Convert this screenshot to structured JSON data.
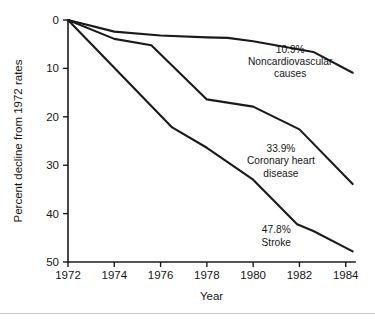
{
  "chart_data": {
    "type": "line",
    "title": "",
    "subtitle": "",
    "xlabel": "Year",
    "ylabel": "Percent decline from 1972 rates",
    "x": [
      1972,
      1974,
      1976,
      1978,
      1980,
      1982,
      1984
    ],
    "xlim": [
      1972,
      1984.4
    ],
    "ylim": [
      0,
      50
    ],
    "y_inverted": true,
    "xticks": [
      "1972",
      "1974",
      "1976",
      "1978",
      "1980",
      "1982",
      "1984"
    ],
    "yticks": [
      "0",
      "10",
      "20",
      "30",
      "40",
      "50"
    ],
    "ytick_values": [
      0,
      10,
      20,
      30,
      40,
      50
    ],
    "grid": false,
    "legend": "none",
    "series": [
      {
        "name": "Noncardiovascular causes",
        "end_label": "10.9%",
        "points": [
          {
            "x": 1972.0,
            "y": 0.0
          },
          {
            "x": 1974.0,
            "y": 2.4
          },
          {
            "x": 1976.0,
            "y": 3.2
          },
          {
            "x": 1978.0,
            "y": 3.6
          },
          {
            "x": 1978.9,
            "y": 3.7
          },
          {
            "x": 1980.0,
            "y": 4.4
          },
          {
            "x": 1982.0,
            "y": 6.1
          },
          {
            "x": 1982.6,
            "y": 6.6
          },
          {
            "x": 1984.3,
            "y": 10.9
          }
        ]
      },
      {
        "name": "Coronary heart disease",
        "end_label": "33.9%",
        "points": [
          {
            "x": 1972.0,
            "y": 0.0
          },
          {
            "x": 1974.0,
            "y": 3.9
          },
          {
            "x": 1975.6,
            "y": 5.2
          },
          {
            "x": 1978.0,
            "y": 16.4
          },
          {
            "x": 1980.0,
            "y": 17.9
          },
          {
            "x": 1982.0,
            "y": 22.6
          },
          {
            "x": 1984.3,
            "y": 33.9
          }
        ]
      },
      {
        "name": "Stroke",
        "end_label": "47.8%",
        "points": [
          {
            "x": 1972.0,
            "y": 0.0
          },
          {
            "x": 1976.5,
            "y": 22.2
          },
          {
            "x": 1978.0,
            "y": 26.4
          },
          {
            "x": 1980.0,
            "y": 33.0
          },
          {
            "x": 1981.9,
            "y": 42.2
          },
          {
            "x": 1982.6,
            "y": 43.6
          },
          {
            "x": 1984.3,
            "y": 47.8
          }
        ]
      }
    ],
    "annotations": [
      {
        "id": "noncardiovascular",
        "lines": [
          "10.9%",
          "Noncardiovascular",
          "causes"
        ],
        "x": 1981.6,
        "y": 6.8
      },
      {
        "id": "coronary-heart-disease",
        "lines": [
          "33.9%",
          "Coronary heart",
          "disease"
        ],
        "x": 1981.2,
        "y": 27.3
      },
      {
        "id": "stroke",
        "lines": [
          "47.8%",
          "Stroke"
        ],
        "x": 1981.0,
        "y": 44.1
      }
    ],
    "colors": {
      "line": "#1a1a1a",
      "axis": "#1a1a1a",
      "text": "#161616",
      "background": "#ffffff",
      "footer_rule": "#c9c9c9"
    }
  }
}
